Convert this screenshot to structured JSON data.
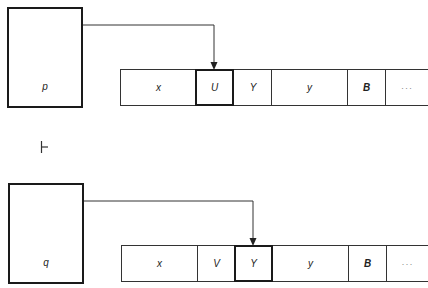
{
  "configurations": [
    {
      "state": "p",
      "head_index": 1,
      "tape": [
        {
          "symbol": "x",
          "bold": false
        },
        {
          "symbol": "U",
          "bold": false
        },
        {
          "symbol": "Y",
          "bold": false
        },
        {
          "symbol": "y",
          "bold": false
        },
        {
          "symbol": "B",
          "bold": true
        },
        {
          "symbol": "···",
          "bold": false
        }
      ]
    },
    {
      "state": "q",
      "head_index": 2,
      "tape": [
        {
          "symbol": "x",
          "bold": false
        },
        {
          "symbol": "V",
          "bold": false
        },
        {
          "symbol": "Y",
          "bold": false
        },
        {
          "symbol": "y",
          "bold": false
        },
        {
          "symbol": "B",
          "bold": true
        },
        {
          "symbol": "···",
          "bold": false
        }
      ]
    }
  ],
  "yields_symbol": "turnstile",
  "colors": {
    "stroke": "#1a1a1a",
    "background": "#ffffff"
  }
}
